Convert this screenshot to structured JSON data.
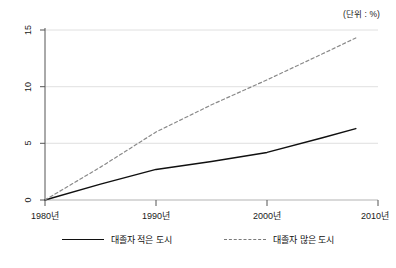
{
  "unit_note": "(단위 : %)",
  "chart_data": {
    "type": "line",
    "title": "",
    "subtitle": "",
    "xlabel": "",
    "ylabel": "",
    "unit": "(단위 : %)",
    "xlim": [
      1980,
      2010
    ],
    "ylim": [
      0,
      15
    ],
    "grid": true,
    "grid_axis": "y",
    "legend_position": "bottom",
    "x_ticks": [
      1980,
      1990,
      2000,
      2010
    ],
    "x_tick_labels": [
      "1980년",
      "1990년",
      "2000년",
      "2010년"
    ],
    "y_ticks": [
      0,
      5,
      10,
      15
    ],
    "y_tick_labels": [
      "0",
      "5",
      "10",
      "15"
    ],
    "x": [
      1980,
      1985,
      1990,
      1995,
      2000,
      2005,
      2008
    ],
    "series": [
      {
        "name": "대졸자 적은 도시",
        "style": "solid",
        "color": "#101010",
        "values": [
          0,
          1.4,
          2.7,
          3.4,
          4.2,
          5.5,
          6.3
        ]
      },
      {
        "name": "대졸자 많은 도시",
        "style": "dashed",
        "color": "#8a8a8a",
        "values": [
          0,
          2.9,
          6.0,
          8.4,
          10.6,
          12.9,
          14.3
        ]
      }
    ],
    "annotations": []
  },
  "legend": {
    "items": [
      {
        "label": "대졸자 적은 도시",
        "style": "solid"
      },
      {
        "label": "대졸자 많은 도시",
        "style": "dashed"
      }
    ]
  },
  "axis": {
    "y_labels": [
      "15",
      "10",
      "5",
      "0"
    ],
    "x_labels": [
      "1980년",
      "1990년",
      "2000년",
      "2010년"
    ]
  }
}
